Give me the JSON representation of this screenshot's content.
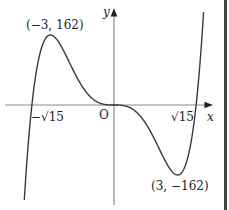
{
  "chart_data": {
    "type": "line",
    "function": "y = x^5 - 15x^3",
    "title": "",
    "xlabel": "x",
    "ylabel": "y",
    "origin_label": "O",
    "x_intercepts": [
      {
        "label": "−√15",
        "value": -3.873
      },
      {
        "label": "O",
        "value": 0
      },
      {
        "label": "√15",
        "value": 3.873
      }
    ],
    "annotations": [
      {
        "label": "(−3, 162)",
        "x": -3,
        "y": 162,
        "type": "local maximum"
      },
      {
        "label": "(3, −162)",
        "x": 3,
        "y": -162,
        "type": "local minimum"
      }
    ],
    "xlim": [
      -5.3,
      5.3
    ],
    "grid": false,
    "legend": false
  },
  "labels": {
    "y_axis": "y",
    "x_axis": "x",
    "origin": "O",
    "neg_root": "−√15",
    "pos_root": "√15",
    "max_point": "(−3, 162)",
    "min_point": "(3, −162)"
  },
  "colors": {
    "curve": "#3a3a3a",
    "axis": "#8a8a8a",
    "border": "#444444"
  }
}
